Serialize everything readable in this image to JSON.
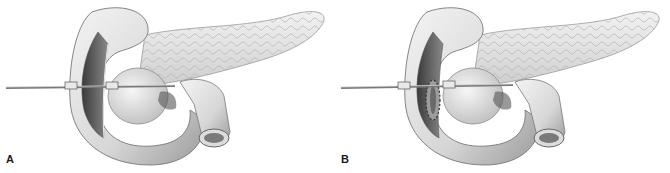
{
  "figure": {
    "panels": [
      {
        "id": "A",
        "label": "A",
        "description": "Pancreas and duodenum with duodenotomy and probe passed through ampulla"
      },
      {
        "id": "B",
        "label": "B",
        "description": "Same view with sutured sphincteroplasty around ampulla and probe in place"
      }
    ],
    "colors": {
      "background": "#ffffff",
      "tissue_light": "#e6e6e6",
      "tissue_mid": "#bdbdbd",
      "tissue_dark": "#4a4a4a",
      "outline": "#6e6e6e"
    }
  }
}
